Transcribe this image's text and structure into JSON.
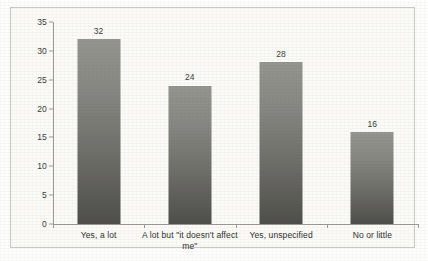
{
  "chart_data": {
    "type": "bar",
    "title": "",
    "subtitle": "",
    "xlabel": "",
    "ylabel": "",
    "categories": [
      "Yes, a lot",
      "A lot but \"it doesn't affect me\"",
      "Yes, unspecified",
      "No or little"
    ],
    "values": [
      32,
      24,
      28,
      16
    ],
    "data_labels": [
      "32",
      "24",
      "28",
      "16"
    ],
    "ylim": [
      0,
      35
    ],
    "ytick_values": [
      0,
      5,
      10,
      15,
      20,
      25,
      30,
      35
    ],
    "ytick_labels": [
      "0",
      "5",
      "10",
      "15",
      "20",
      "25",
      "30",
      "35"
    ],
    "grid": false,
    "legend": false,
    "legend_position": "none",
    "bar_color": "#7a7a76",
    "axis_color": "#9a9a96",
    "text_color": "#3a3a3a",
    "plot_background": "#fbfbf8",
    "frame_border_color": "#c9c9c4"
  }
}
